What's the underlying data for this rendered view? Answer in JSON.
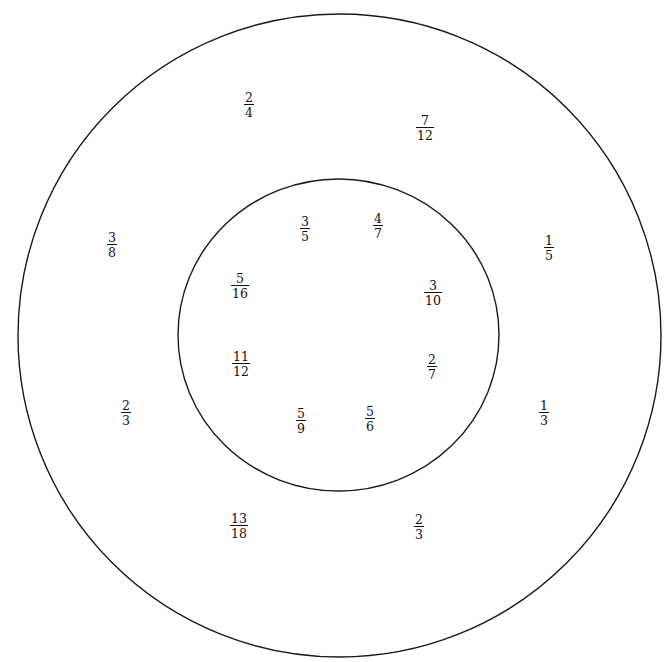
{
  "diagram": {
    "type": "concentric-circles-fractions",
    "colors": {
      "stroke": "#1a1a1a",
      "text": "#111111",
      "background": "#ffffff"
    },
    "outer_circle": {
      "cx": 339.5,
      "cy": 335.5,
      "r": 321.5
    },
    "inner_circle": {
      "cx": 338.5,
      "cy": 335,
      "rx": 160.5,
      "ry": 156
    },
    "outer_ring_fractions": [
      {
        "num": "2",
        "den": "4",
        "x": 249,
        "y": 105
      },
      {
        "num": "7",
        "den": "12",
        "x": 425,
        "y": 128
      },
      {
        "num": "3",
        "den": "8",
        "x": 112,
        "y": 245
      },
      {
        "num": "1",
        "den": "5",
        "x": 549,
        "y": 248
      },
      {
        "num": "2",
        "den": "3",
        "x": 126,
        "y": 413
      },
      {
        "num": "1",
        "den": "3",
        "x": 544,
        "y": 413
      },
      {
        "num": "13",
        "den": "18",
        "x": 239,
        "y": 526
      },
      {
        "num": "2",
        "den": "3",
        "x": 419,
        "y": 527
      }
    ],
    "inner_circle_fractions": [
      {
        "num": "3",
        "den": "5",
        "x": 305,
        "y": 229
      },
      {
        "num": "4",
        "den": "7",
        "x": 378,
        "y": 226
      },
      {
        "num": "5",
        "den": "16",
        "x": 240,
        "y": 286
      },
      {
        "num": "3",
        "den": "10",
        "x": 433,
        "y": 293
      },
      {
        "num": "11",
        "den": "12",
        "x": 241,
        "y": 364
      },
      {
        "num": "2",
        "den": "7",
        "x": 432,
        "y": 367
      },
      {
        "num": "5",
        "den": "9",
        "x": 301,
        "y": 421
      },
      {
        "num": "5",
        "den": "6",
        "x": 370,
        "y": 419
      }
    ]
  }
}
